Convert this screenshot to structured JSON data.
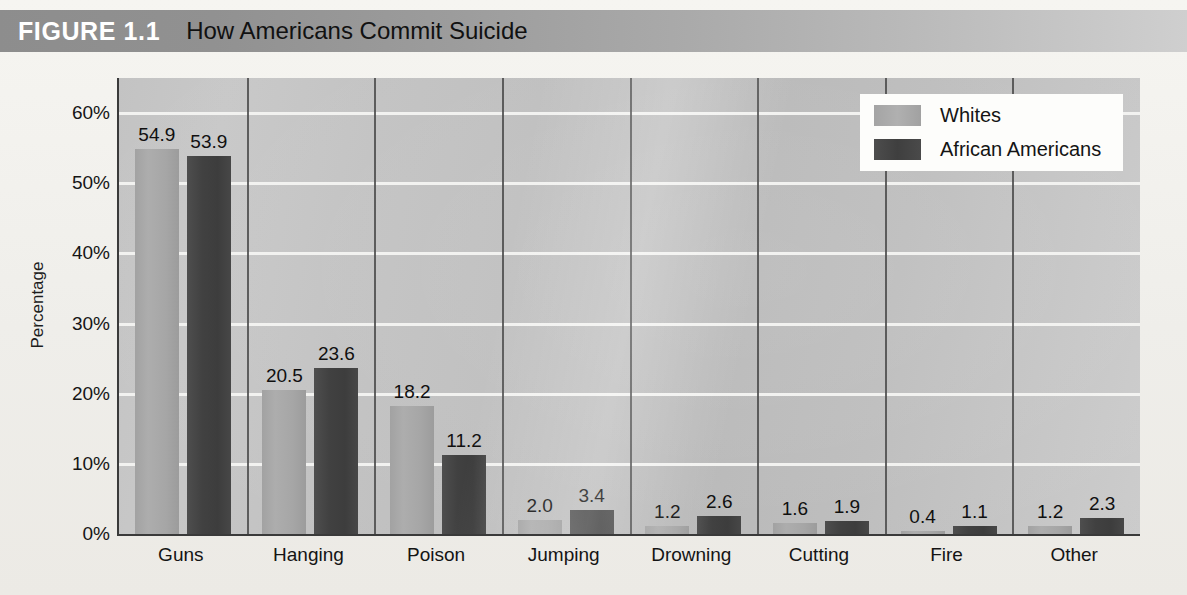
{
  "header": {
    "figure_number": "FIGURE 1.1",
    "title": "How Americans Commit Suicide",
    "bar_color_left": "#8d8d8d",
    "bar_color_right": "#cfcfcf"
  },
  "legend": {
    "position": "top-right",
    "entries": [
      {
        "label": "Whites",
        "color": "#a8a8a8"
      },
      {
        "label": "African Americans",
        "color": "#444444"
      }
    ]
  },
  "axes": {
    "y_title": "Percentage",
    "y_ticks": [
      "60%",
      "50%",
      "40%",
      "30%",
      "20%",
      "10%",
      "0%"
    ],
    "y_tick_values": [
      60,
      50,
      40,
      30,
      20,
      10,
      0
    ]
  },
  "chart_data": {
    "type": "bar",
    "title": "How Americans Commit Suicide",
    "xlabel": "",
    "ylabel": "Percentage",
    "ylim": [
      0,
      65
    ],
    "grid": true,
    "legend_position": "top-right",
    "categories": [
      "Guns",
      "Hanging",
      "Poison",
      "Jumping",
      "Drowning",
      "Cutting",
      "Fire",
      "Other"
    ],
    "series": [
      {
        "name": "Whites",
        "color": "#a8a8a8",
        "values": [
          54.9,
          20.5,
          18.2,
          2.0,
          1.2,
          1.6,
          0.4,
          1.2
        ],
        "labels": [
          "54.9",
          "20.5",
          "18.2",
          "2.0",
          "1.2",
          "1.6",
          "0.4",
          "1.2"
        ]
      },
      {
        "name": "African Americans",
        "color": "#444444",
        "values": [
          53.9,
          23.6,
          11.2,
          3.4,
          2.6,
          1.9,
          1.1,
          2.3
        ],
        "labels": [
          "53.9",
          "23.6",
          "11.2",
          "3.4",
          "2.6",
          "1.9",
          "1.1",
          "2.3"
        ]
      }
    ]
  }
}
